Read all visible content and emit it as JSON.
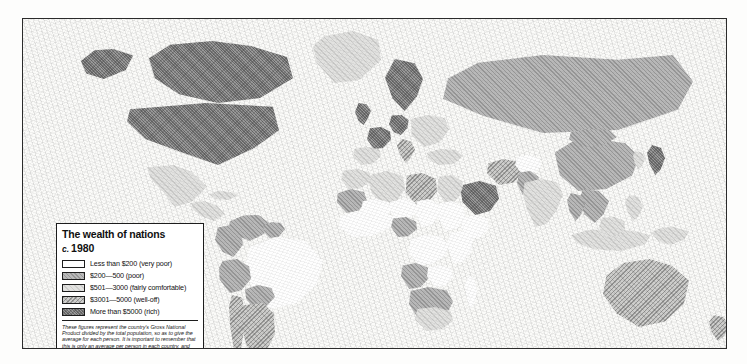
{
  "map": {
    "title": "The wealth of nations",
    "date_prefix": "c.",
    "date": "1980",
    "projection_note": "world choropleth"
  },
  "legend": {
    "items": [
      {
        "label": "Less than $200 (very poor)",
        "tier": "t1",
        "range_min": 0,
        "range_max": 200
      },
      {
        "label": "$200—500 (poor)",
        "tier": "t2",
        "range_min": 200,
        "range_max": 500
      },
      {
        "label": "$501—3000 (fairly comfortable)",
        "tier": "t3",
        "range_min": 501,
        "range_max": 3000
      },
      {
        "label": "$3001—5000 (well-off)",
        "tier": "t4",
        "range_min": 3001,
        "range_max": 5000
      },
      {
        "label": "More than $5000 (rich)",
        "tier": "t5",
        "range_min": 5000,
        "range_max": null
      }
    ],
    "note": "These figures represent the country's Gross National Product divided by the total population, so as to give the average for each person. It is important to remember that this is only an average per person in each country, and that in some places there may be sections of the population far richer or poorer than the average."
  },
  "colors": {
    "tier1": "#fefefe",
    "tier2": "#b9b9b9",
    "tier3": "#e2e2e0",
    "tier4": "#cfcfcd",
    "tier5": "#9a9a9a",
    "border": "#111111",
    "frame": "#2b2b2b",
    "ocean": "#fbfbf9"
  },
  "chart_data": {
    "type": "map",
    "measure": "Gross National Product per person (US$)",
    "categories": [
      "Less than $200 (very poor)",
      "$200—500 (poor)",
      "$501—3000 (fairly comfortable)",
      "$3001—5000 (well-off)",
      "More than $5000 (rich)"
    ],
    "regions": [
      {
        "name": "Canada",
        "tier": 5,
        "x": 120,
        "y": 22,
        "w": 150,
        "h": 62,
        "shape": "poly1"
      },
      {
        "name": "Alaska",
        "tier": 5,
        "x": 58,
        "y": 30,
        "w": 52,
        "h": 30,
        "shape": "poly2"
      },
      {
        "name": "Greenland",
        "tier": 3,
        "x": 290,
        "y": 12,
        "w": 68,
        "h": 52,
        "shape": "poly3"
      },
      {
        "name": "United States",
        "tier": 5,
        "x": 104,
        "y": 84,
        "w": 152,
        "h": 62,
        "shape": "poly4"
      },
      {
        "name": "Mexico",
        "tier": 3,
        "x": 124,
        "y": 146,
        "w": 60,
        "h": 42,
        "shape": "poly5"
      },
      {
        "name": "Central America",
        "tier": 3,
        "x": 168,
        "y": 182,
        "w": 34,
        "h": 20,
        "shape": "poly6"
      },
      {
        "name": "Cuba",
        "tier": 3,
        "x": 186,
        "y": 172,
        "w": 30,
        "h": 9,
        "shape": "poly7"
      },
      {
        "name": "Venezuela",
        "tier": 2,
        "x": 206,
        "y": 196,
        "w": 40,
        "h": 26,
        "shape": "poly8"
      },
      {
        "name": "Colombia",
        "tier": 2,
        "x": 192,
        "y": 206,
        "w": 28,
        "h": 32,
        "shape": "poly9"
      },
      {
        "name": "Guyanas",
        "tier": 2,
        "x": 240,
        "y": 203,
        "w": 22,
        "h": 16,
        "shape": "poly10"
      },
      {
        "name": "Brazil",
        "tier": 1,
        "x": 222,
        "y": 218,
        "w": 78,
        "h": 72,
        "shape": "poly11"
      },
      {
        "name": "Peru",
        "tier": 2,
        "x": 196,
        "y": 240,
        "w": 32,
        "h": 34,
        "shape": "poly12"
      },
      {
        "name": "Bolivia",
        "tier": 2,
        "x": 222,
        "y": 266,
        "w": 30,
        "h": 24,
        "shape": "poly13"
      },
      {
        "name": "Chile",
        "tier": 4,
        "x": 206,
        "y": 276,
        "w": 16,
        "h": 62,
        "shape": "poly14"
      },
      {
        "name": "Argentina",
        "tier": 4,
        "x": 218,
        "y": 284,
        "w": 34,
        "h": 58,
        "shape": "poly15"
      },
      {
        "name": "United Kingdom",
        "tier": 5,
        "x": 332,
        "y": 84,
        "w": 16,
        "h": 22,
        "shape": "poly16"
      },
      {
        "name": "Scandinavia",
        "tier": 5,
        "x": 362,
        "y": 40,
        "w": 38,
        "h": 52,
        "shape": "poly17"
      },
      {
        "name": "France",
        "tier": 5,
        "x": 344,
        "y": 108,
        "w": 24,
        "h": 22,
        "shape": "poly18"
      },
      {
        "name": "Iberia",
        "tier": 3,
        "x": 330,
        "y": 128,
        "w": 28,
        "h": 18,
        "shape": "poly19"
      },
      {
        "name": "West Germany",
        "tier": 5,
        "x": 366,
        "y": 96,
        "w": 20,
        "h": 20,
        "shape": "poly20"
      },
      {
        "name": "Italy",
        "tier": 4,
        "x": 374,
        "y": 120,
        "w": 18,
        "h": 24,
        "shape": "poly21"
      },
      {
        "name": "Eastern Europe",
        "tier": 3,
        "x": 386,
        "y": 96,
        "w": 40,
        "h": 32,
        "shape": "poly22"
      },
      {
        "name": "USSR",
        "tier": 2,
        "x": 420,
        "y": 36,
        "w": 250,
        "h": 78,
        "shape": "poly23"
      },
      {
        "name": "Turkey",
        "tier": 3,
        "x": 404,
        "y": 130,
        "w": 36,
        "h": 16,
        "shape": "poly24"
      },
      {
        "name": "Morocco",
        "tier": 3,
        "x": 318,
        "y": 150,
        "w": 30,
        "h": 20,
        "shape": "poly25"
      },
      {
        "name": "Algeria",
        "tier": 3,
        "x": 346,
        "y": 152,
        "w": 36,
        "h": 34,
        "shape": "poly26"
      },
      {
        "name": "Libya",
        "tier": 4,
        "x": 382,
        "y": 154,
        "w": 32,
        "h": 32,
        "shape": "poly27"
      },
      {
        "name": "Egypt",
        "tier": 3,
        "x": 414,
        "y": 156,
        "w": 26,
        "h": 28,
        "shape": "poly28"
      },
      {
        "name": "Mauritania",
        "tier": 2,
        "x": 314,
        "y": 170,
        "w": 30,
        "h": 24,
        "shape": "poly29"
      },
      {
        "name": "Mali",
        "tier": 1,
        "x": 338,
        "y": 180,
        "w": 30,
        "h": 22,
        "shape": "poly30"
      },
      {
        "name": "Niger",
        "tier": 1,
        "x": 366,
        "y": 180,
        "w": 28,
        "h": 22,
        "shape": "poly31"
      },
      {
        "name": "Chad",
        "tier": 1,
        "x": 392,
        "y": 180,
        "w": 24,
        "h": 28,
        "shape": "poly32"
      },
      {
        "name": "Sudan",
        "tier": 1,
        "x": 414,
        "y": 182,
        "w": 28,
        "h": 30,
        "shape": "poly33"
      },
      {
        "name": "West Africa",
        "tier": 1,
        "x": 316,
        "y": 192,
        "w": 56,
        "h": 26,
        "shape": "poly34"
      },
      {
        "name": "Nigeria",
        "tier": 2,
        "x": 368,
        "y": 198,
        "w": 26,
        "h": 20,
        "shape": "poly35"
      },
      {
        "name": "Ethiopia",
        "tier": 1,
        "x": 438,
        "y": 196,
        "w": 28,
        "h": 24,
        "shape": "poly36"
      },
      {
        "name": "Zaire",
        "tier": 1,
        "x": 386,
        "y": 216,
        "w": 40,
        "h": 30,
        "shape": "poly37"
      },
      {
        "name": "East Africa",
        "tier": 1,
        "x": 424,
        "y": 212,
        "w": 26,
        "h": 32,
        "shape": "poly38"
      },
      {
        "name": "Angola",
        "tier": 2,
        "x": 378,
        "y": 244,
        "w": 28,
        "h": 26,
        "shape": "poly39"
      },
      {
        "name": "Zambia",
        "tier": 1,
        "x": 404,
        "y": 246,
        "w": 26,
        "h": 22,
        "shape": "poly40"
      },
      {
        "name": "Southern Africa",
        "tier": 2,
        "x": 386,
        "y": 268,
        "w": 44,
        "h": 34,
        "shape": "poly41"
      },
      {
        "name": "South Africa",
        "tier": 3,
        "x": 392,
        "y": 288,
        "w": 38,
        "h": 24,
        "shape": "poly42"
      },
      {
        "name": "Madagascar",
        "tier": 1,
        "x": 442,
        "y": 256,
        "w": 12,
        "h": 34,
        "shape": "poly43"
      },
      {
        "name": "Saudi Arabia",
        "tier": 5,
        "x": 438,
        "y": 162,
        "w": 38,
        "h": 34,
        "shape": "poly44"
      },
      {
        "name": "Iran",
        "tier": 4,
        "x": 464,
        "y": 140,
        "w": 36,
        "h": 26,
        "shape": "poly45"
      },
      {
        "name": "Afghanistan",
        "tier": 1,
        "x": 492,
        "y": 136,
        "w": 26,
        "h": 20,
        "shape": "poly46"
      },
      {
        "name": "Pakistan",
        "tier": 2,
        "x": 494,
        "y": 152,
        "w": 22,
        "h": 24,
        "shape": "poly47"
      },
      {
        "name": "India",
        "tier": 3,
        "x": 500,
        "y": 160,
        "w": 40,
        "h": 48,
        "shape": "poly48"
      },
      {
        "name": "China",
        "tier": 2,
        "x": 530,
        "y": 120,
        "w": 86,
        "h": 52,
        "shape": "poly49"
      },
      {
        "name": "Mongolia",
        "tier": 2,
        "x": 546,
        "y": 110,
        "w": 48,
        "h": 18,
        "shape": "poly50"
      },
      {
        "name": "Japan",
        "tier": 5,
        "x": 624,
        "y": 126,
        "w": 18,
        "h": 30,
        "shape": "poly51"
      },
      {
        "name": "Korea",
        "tier": 3,
        "x": 610,
        "y": 132,
        "w": 12,
        "h": 18,
        "shape": "poly52"
      },
      {
        "name": "Indochina",
        "tier": 2,
        "x": 556,
        "y": 170,
        "w": 30,
        "h": 34,
        "shape": "poly53"
      },
      {
        "name": "Thailand",
        "tier": 2,
        "x": 544,
        "y": 174,
        "w": 18,
        "h": 28,
        "shape": "poly54"
      },
      {
        "name": "Philippines",
        "tier": 3,
        "x": 602,
        "y": 176,
        "w": 18,
        "h": 26,
        "shape": "poly55"
      },
      {
        "name": "Indonesia",
        "tier": 3,
        "x": 548,
        "y": 210,
        "w": 80,
        "h": 22,
        "shape": "poly56"
      },
      {
        "name": "Borneo",
        "tier": 3,
        "x": 576,
        "y": 198,
        "w": 26,
        "h": 20,
        "shape": "poly57"
      },
      {
        "name": "New Guinea",
        "tier": 3,
        "x": 628,
        "y": 208,
        "w": 38,
        "h": 18,
        "shape": "poly58"
      },
      {
        "name": "Australia",
        "tier": 4,
        "x": 580,
        "y": 240,
        "w": 86,
        "h": 68,
        "shape": "poly59"
      },
      {
        "name": "New Zealand",
        "tier": 4,
        "x": 686,
        "y": 296,
        "w": 20,
        "h": 26,
        "shape": "poly60"
      }
    ]
  }
}
